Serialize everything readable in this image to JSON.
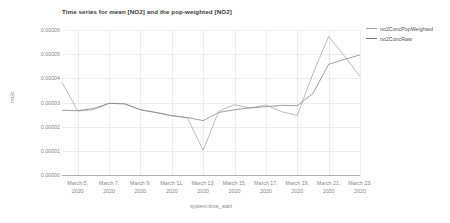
{
  "chart_data": {
    "type": "line",
    "title": "Time series for mean [NO2] and the pop-weighted [NO2]",
    "xlabel": "system:time_start",
    "ylabel": "no2c",
    "grid": true,
    "legend_position": "right",
    "ylim": [
      0.0,
      6e-05
    ],
    "yticks": [
      0.0,
      1e-05,
      2e-05,
      3e-05,
      4e-05,
      5e-05,
      6e-05
    ],
    "ytick_labels": [
      "0.00000",
      "0.00001",
      "0.00002",
      "0.00003",
      "0.00004",
      "0.00005",
      "0.00006"
    ],
    "x": [
      "March 4, 2020",
      "March 5, 2020",
      "March 6, 2020",
      "March 7, 2020",
      "March 8, 2020",
      "March 9, 2020",
      "March 10, 2020",
      "March 11, 2020",
      "March 12, 2020",
      "March 13, 2020",
      "March 14, 2020",
      "March 15, 2020",
      "March 16, 2020",
      "March 17, 2020",
      "March 18, 2020",
      "March 19, 2020",
      "March 20, 2020",
      "March 21, 2020",
      "March 22, 2020",
      "March 23, 2020"
    ],
    "xticks": [
      "March 5, 2020",
      "March 7, 2020",
      "March 9, 2020",
      "March 11, 2020",
      "March 13, 2020",
      "March 15, 2020",
      "March 17, 2020",
      "March 19, 2020",
      "March 21, 2020",
      "March 23, 2020"
    ],
    "xtick_labels": [
      {
        "line1": "March 5,",
        "line2": "2020"
      },
      {
        "line1": "March 7,",
        "line2": "2020"
      },
      {
        "line1": "March 9,",
        "line2": "2020"
      },
      {
        "line1": "March 11,",
        "line2": "2020"
      },
      {
        "line1": "March 13,",
        "line2": "2020"
      },
      {
        "line1": "March 15,",
        "line2": "2020"
      },
      {
        "line1": "March 17,",
        "line2": "2020"
      },
      {
        "line1": "March 19,",
        "line2": "2020"
      },
      {
        "line1": "March 21,",
        "line2": "2020"
      },
      {
        "line1": "March 23,",
        "line2": "2020"
      }
    ],
    "series": [
      {
        "name": "no2ConcPopWeighted",
        "color": "#9aa0a6",
        "values": [
          3.83e-05,
          2.65e-05,
          2.7e-05,
          2.96e-05,
          2.95e-05,
          2.7e-05,
          2.58e-05,
          2.44e-05,
          2.36e-05,
          1.02e-05,
          2.64e-05,
          2.91e-05,
          2.77e-05,
          2.9e-05,
          2.62e-05,
          2.46e-05,
          4.19e-05,
          5.73e-05,
          4.93e-05,
          4.08e-05
        ]
      },
      {
        "name": "no2ConcRaw",
        "color": "#77797c",
        "values": [
          2.68e-05,
          2.66e-05,
          2.75e-05,
          2.97e-05,
          2.94e-05,
          2.7e-05,
          2.59e-05,
          2.46e-05,
          2.38e-05,
          2.25e-05,
          2.59e-05,
          2.7e-05,
          2.78e-05,
          2.83e-05,
          2.88e-05,
          2.87e-05,
          3.37e-05,
          4.58e-05,
          4.78e-05,
          4.97e-05
        ]
      }
    ]
  },
  "legend": {
    "items": [
      {
        "label": "no2ConcPopWeighted",
        "color": "#9aa0a6"
      },
      {
        "label": "no2ConcRaw",
        "color": "#77797c"
      }
    ]
  }
}
